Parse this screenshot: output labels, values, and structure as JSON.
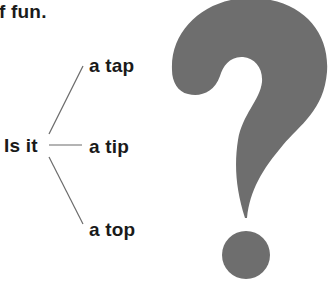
{
  "top_text": "f fun.",
  "tree": {
    "root": "Is it",
    "branches": [
      {
        "label": "a tap"
      },
      {
        "label": "a tip"
      },
      {
        "label": "a top"
      }
    ]
  },
  "graphic": {
    "icon": "question-mark-icon",
    "color": "#6e6e6e"
  },
  "colors": {
    "text": "#1a1a1a",
    "line": "#6b6b6b",
    "background": "#ffffff"
  }
}
